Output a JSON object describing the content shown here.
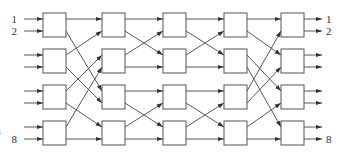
{
  "diagram": {
    "stages": 5,
    "switches_per_stage": 4,
    "switch_size": "2x2",
    "input_labels": [
      {
        "line": 1,
        "text": "1"
      },
      {
        "line": 2,
        "text": "2"
      },
      {
        "line": 8,
        "text": "8"
      }
    ],
    "output_labels": [
      {
        "line": 1,
        "text": "1"
      },
      {
        "line": 2,
        "text": "2"
      },
      {
        "line": 8,
        "text": "8"
      }
    ],
    "clipped_left_glyph": "s",
    "layout": {
      "stage_x": [
        43,
        102,
        163,
        224,
        281
      ],
      "box_width": 23,
      "box_height": 24,
      "box_top": [
        13,
        49,
        85,
        121
      ],
      "port_offsets": [
        6,
        18
      ],
      "input_stub_x": 24,
      "output_stub_end_x": 322
    },
    "interconnects": [
      {
        "between": "stage1-stage2",
        "pattern": "inverse-shuffle",
        "map": [
          1,
          5,
          2,
          6,
          3,
          7,
          4,
          8
        ]
      },
      {
        "between": "stage2-stage3",
        "pattern": "pair-exchange",
        "map": [
          1,
          3,
          2,
          4,
          5,
          7,
          6,
          8
        ]
      },
      {
        "between": "stage3-stage4",
        "pattern": "pair-exchange",
        "map": [
          1,
          3,
          2,
          4,
          5,
          7,
          6,
          8
        ]
      },
      {
        "between": "stage4-stage5",
        "pattern": "perfect-shuffle",
        "map": [
          1,
          3,
          5,
          7,
          2,
          4,
          6,
          8
        ]
      }
    ],
    "colors": {
      "line": "#444444",
      "box_stroke": "#555555",
      "text": "#333333",
      "background": "#ffffff"
    }
  }
}
